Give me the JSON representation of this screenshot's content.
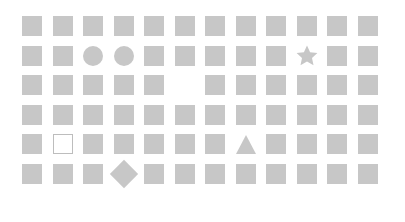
{
  "canvas": {
    "width": 405,
    "height": 222,
    "background_color": "#ffffff"
  },
  "grid": {
    "columns": 12,
    "rows": 6,
    "cell_size": 20,
    "column_step": 30.5,
    "row_step": 29.5,
    "origin_x": 22,
    "origin_y": 16,
    "shape_fill_color": "#c7c7c7",
    "outline_stroke_color": "#bdbdbd"
  },
  "legend": {
    "square": "filled-square",
    "square_outline": "outlined-square",
    "circle": "filled-circle",
    "star": "filled-star",
    "triangle": "filled-triangle",
    "diamond": "filled-diamond",
    "empty": "missing-cell"
  },
  "cells": [
    [
      "square",
      "square",
      "square",
      "square",
      "square",
      "square",
      "square",
      "square",
      "square",
      "square",
      "square",
      "square"
    ],
    [
      "square",
      "square",
      "circle",
      "circle",
      "square",
      "square",
      "square",
      "square",
      "square",
      "star",
      "square",
      "square"
    ],
    [
      "square",
      "square",
      "square",
      "square",
      "square",
      "empty",
      "square",
      "square",
      "square",
      "square",
      "square",
      "square"
    ],
    [
      "square",
      "square",
      "square",
      "square",
      "square",
      "square",
      "square",
      "square",
      "square",
      "square",
      "square",
      "square"
    ],
    [
      "square",
      "square_outline",
      "square",
      "square",
      "square",
      "square",
      "square",
      "triangle",
      "square",
      "square",
      "square",
      "square"
    ],
    [
      "square",
      "square",
      "square",
      "diamond",
      "square",
      "square",
      "square",
      "square",
      "square",
      "square",
      "square",
      "square"
    ]
  ],
  "anomalies": [
    {
      "row": 2,
      "column": 3,
      "type": "circle"
    },
    {
      "row": 2,
      "column": 4,
      "type": "circle"
    },
    {
      "row": 2,
      "column": 10,
      "type": "star"
    },
    {
      "row": 3,
      "column": 6,
      "type": "empty"
    },
    {
      "row": 5,
      "column": 2,
      "type": "square_outline"
    },
    {
      "row": 5,
      "column": 8,
      "type": "triangle"
    },
    {
      "row": 6,
      "column": 4,
      "type": "diamond"
    }
  ],
  "counts": {
    "total_positions": 72,
    "filled_squares": 64,
    "circles": 2,
    "stars": 1,
    "triangles": 1,
    "diamonds": 1,
    "outlined_squares": 1,
    "empty_positions": 1
  }
}
